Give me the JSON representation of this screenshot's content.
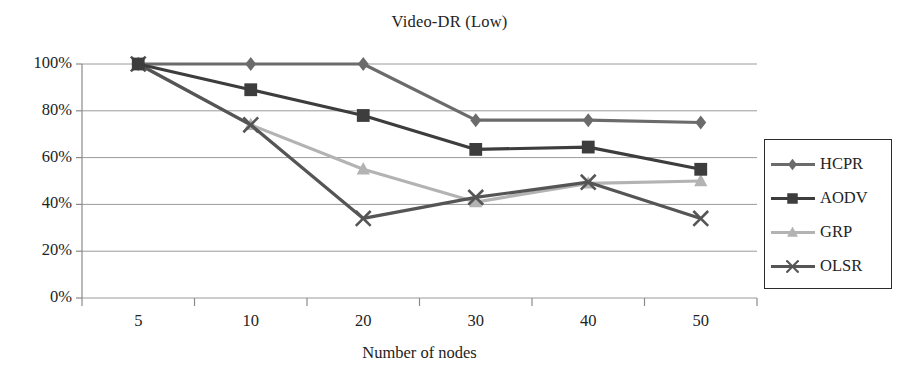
{
  "chart_data": {
    "type": "line",
    "title": "Video-DR (Low)",
    "xlabel": "Number of nodes",
    "ylabel": "",
    "categories": [
      "5",
      "10",
      "20",
      "30",
      "40",
      "50"
    ],
    "x": [
      5,
      10,
      20,
      30,
      40,
      50
    ],
    "ylim": [
      0,
      100
    ],
    "ytick_labels": [
      "0%",
      "20%",
      "40%",
      "60%",
      "80%",
      "100%"
    ],
    "ytick_values": [
      0,
      20,
      40,
      60,
      80,
      100
    ],
    "grid": true,
    "legend_position": "right",
    "series": [
      {
        "name": "HCPR",
        "marker": "diamond",
        "color": "#6b6b6b",
        "values": [
          100,
          100,
          100,
          76,
          76,
          75
        ]
      },
      {
        "name": "AODV",
        "marker": "square",
        "color": "#3d3d3d",
        "values": [
          100,
          89,
          78,
          63.5,
          64.5,
          55
        ]
      },
      {
        "name": "GRP",
        "marker": "triangle",
        "color": "#b3b3b3",
        "values": [
          100,
          74,
          55,
          41,
          49,
          50
        ]
      },
      {
        "name": "OLSR",
        "marker": "x",
        "color": "#555555",
        "values": [
          100,
          74,
          34,
          43,
          49.5,
          34
        ]
      }
    ]
  },
  "axes": {
    "grid_color": "#9a9a9a",
    "axis_color": "#8a8a8a"
  },
  "legend": {
    "entries": [
      "HCPR",
      "AODV",
      "GRP",
      "OLSR"
    ]
  }
}
